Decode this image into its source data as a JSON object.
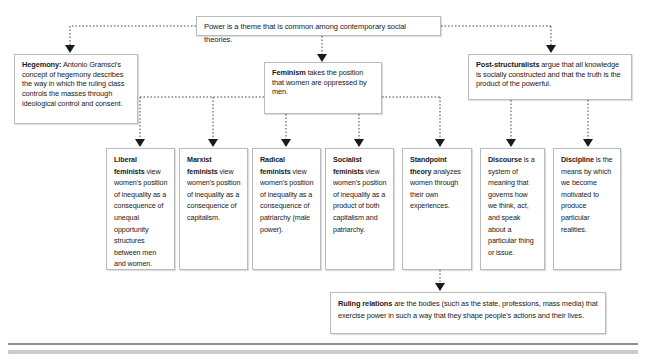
{
  "diagram": {
    "title": "Power is a theme that is common among contemporary social theories.",
    "nodes": {
      "power": {
        "label": "Power is a theme that is common among contemporary social theories.",
        "term": "",
        "rest": "Power is a theme that is common among contemporary social theories."
      },
      "hegemony": {
        "term": "Hegemony:",
        "rest": " Antonio Gramsci's concept of hegemony describes the way in which the ruling class controls the masses through ideological control and consent."
      },
      "feminism": {
        "term": "Feminism",
        "rest": "  takes the position that women are oppressed by men."
      },
      "poststructuralists": {
        "term": "Post-structuralists",
        "rest": "  argue that all knowledge is socially constructed and that the truth is the product of the powerful."
      },
      "liberal": {
        "term": "Liberal feminists",
        "rest": " view women's position of inequality as a consequence of unequal opportunity structures between men and women."
      },
      "marxist": {
        "term": "Marxist feminists",
        "rest": " view women's position of inequality as a consequence of capitalism."
      },
      "radical": {
        "term": "Radical feminists",
        "rest": " view women's position of inequality as a consequence of patriarchy (male power)."
      },
      "socialist": {
        "term": "Socialist feminists",
        "rest": " view women's position of inequality as a product of both capitalism and patriarchy."
      },
      "standpoint": {
        "term": "Standpoint theory",
        "rest": "  analyzes women through their own experiences."
      },
      "discourse": {
        "term": "Discourse",
        "rest": " is a system of meaning that governs how we think, act, and speak about a particular thing or issue."
      },
      "discipline": {
        "term": "Discipline",
        "rest": "  is the means by which we become motivated to produce particular realities."
      },
      "ruling": {
        "term": "Ruling relations",
        "rest": "  are the bodies (such as the state, professions, mass media) that exercise power in such a way that they shape people's actions and their lives."
      }
    },
    "colors": {
      "box_border": "#b9bcbe",
      "connector": "#4a4a4a",
      "arrow": "#1b1b1b",
      "text": "#1a1a1a",
      "rule_dark": "#8e9294",
      "rule_light": "#c9cccd"
    }
  }
}
